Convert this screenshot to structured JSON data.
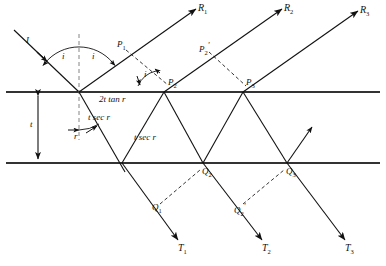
{
  "figure": {
    "type": "optics-ray-diagram"
  },
  "colors": {
    "ink": "#111111",
    "surface": "#333333",
    "background": "#ffffff"
  },
  "surfaces": {
    "top_label": "top-surface",
    "bottom_label": "bottom-surface"
  },
  "labels": {
    "incident_ray": "I",
    "angle_incidence_1": "i",
    "angle_incidence_2": "i",
    "angle_incidence_3": "i",
    "angle_refraction": "r",
    "path_2t_tan_r": "2t tan r",
    "path_t_sec_r_left": "t sec r",
    "path_t_sec_r_right": "t sec r",
    "thickness": "t"
  },
  "reflected_rays": [
    {
      "name": "R1",
      "base": "R",
      "sub": "1"
    },
    {
      "name": "R2",
      "base": "R",
      "sub": "2"
    },
    {
      "name": "R3",
      "base": "R",
      "sub": "3"
    }
  ],
  "transmitted_rays": [
    {
      "name": "T1",
      "base": "T",
      "sub": "1"
    },
    {
      "name": "T2",
      "base": "T",
      "sub": "2"
    },
    {
      "name": "T3",
      "base": "T",
      "sub": "3"
    }
  ],
  "points_top": [
    {
      "name": "P1",
      "base": "P",
      "sub": "1",
      "prime": ""
    },
    {
      "name": "P2",
      "base": "P",
      "sub": "2",
      "prime": ""
    },
    {
      "name": "P2prime",
      "base": "P",
      "sub": "2",
      "prime": "'"
    },
    {
      "name": "P3",
      "base": "P",
      "sub": "3",
      "prime": ""
    }
  ],
  "points_bottom": [
    {
      "name": "Q1",
      "base": "Q",
      "sub": "1",
      "prime": ""
    },
    {
      "name": "Q2",
      "base": "Q",
      "sub": "2",
      "prime": ""
    },
    {
      "name": "Q2prime",
      "base": "Q",
      "sub": "2",
      "prime": "'"
    },
    {
      "name": "Q3",
      "base": "Q",
      "sub": "3",
      "prime": ""
    }
  ]
}
